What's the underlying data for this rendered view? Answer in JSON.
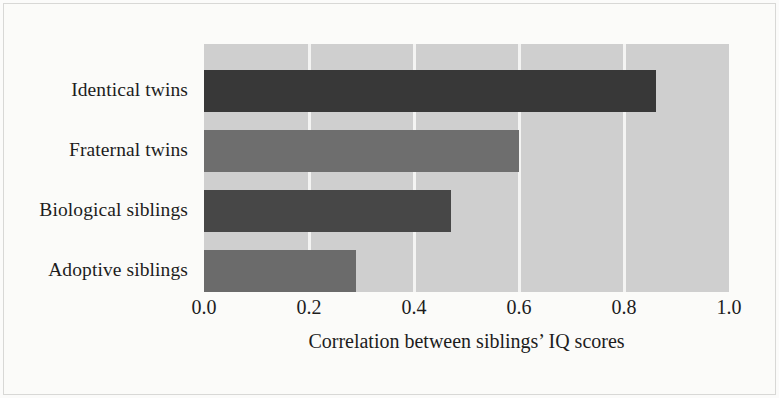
{
  "chart_data": {
    "type": "bar",
    "orientation": "horizontal",
    "title": "",
    "subtitle": "",
    "xlabel": "Correlation between siblings’ IQ scores",
    "ylabel": "",
    "categories": [
      "Identical twins",
      "Fraternal twins",
      "Biological siblings",
      "Adoptive siblings"
    ],
    "values": [
      0.86,
      0.6,
      0.47,
      0.29
    ],
    "series": [
      {
        "name": "Correlation between siblings’ IQ scores",
        "values": [
          0.86,
          0.6,
          0.47,
          0.29
        ]
      }
    ],
    "bar_colors": [
      "#383838",
      "#6e6e6e",
      "#474747",
      "#6b6b6b"
    ],
    "xlim": [
      0.0,
      1.0
    ],
    "xticks": [
      0.0,
      0.2,
      0.4,
      0.6,
      0.8,
      1.0
    ],
    "xtick_labels": [
      "0.0",
      "0.2",
      "0.4",
      "0.6",
      "0.8",
      "1.0"
    ],
    "grid": true,
    "grid_axis": "x",
    "grid_color": "#f4f4f3",
    "legend": false,
    "legend_position": "none",
    "plot_background": "#cfcfcf",
    "figure_background": "#fbfbf9",
    "bars": [
      {
        "label": "Identical twins",
        "value": 0.86,
        "color": "#383838"
      },
      {
        "label": "Fraternal twins",
        "value": 0.6,
        "color": "#6e6e6e"
      },
      {
        "label": "Biological siblings",
        "value": 0.47,
        "color": "#474747"
      },
      {
        "label": "Adoptive siblings",
        "value": 0.29,
        "color": "#6b6b6b"
      }
    ]
  }
}
